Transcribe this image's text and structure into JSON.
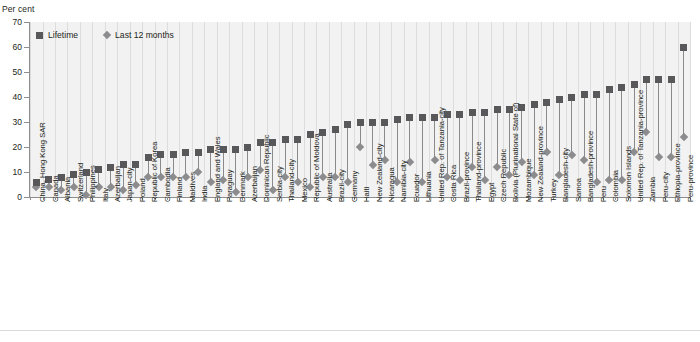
{
  "axis": {
    "y_title": "Per cent",
    "y_ticks": [
      0,
      10,
      20,
      30,
      40,
      50,
      60,
      70
    ]
  },
  "legend": {
    "items": [
      {
        "label": "Lifetime",
        "marker": "square",
        "color": "#58585a"
      },
      {
        "label": "Last 12 months",
        "marker": "diamond",
        "color": "#8c8c8e"
      }
    ]
  },
  "chart_data": {
    "type": "scatter",
    "title": "",
    "subtitle": "",
    "xlabel": "",
    "ylabel": "Per cent",
    "ylim": [
      0,
      70
    ],
    "grid": true,
    "legend_position": "top-left",
    "categories": [
      "China, Hong Kong SAR",
      "Canada",
      "Albania",
      "Switzerland",
      "Philippines",
      "Italy",
      "Azerbaijan",
      "Japan-city",
      "Poland",
      "Republic of Korea",
      "Cambodia",
      "Finland",
      "Maldives",
      "India",
      "England and Wales",
      "Paraguay",
      "Denmark",
      "Azerbaijan",
      "Dominican Republic",
      "Serbia-city",
      "Thailand-city",
      "Mexico",
      "Republic of Moldova",
      "Australia",
      "Brazil-city",
      "Germany",
      "Haiti",
      "New Zealand-city",
      "Nicaragua",
      "Namibia-city",
      "Ecuador",
      "Lithuania",
      "United Rep. of Tanzania-city",
      "Costa Rica",
      "Brazil-province",
      "Thailand-province",
      "Egypt",
      "Czech Republic",
      "Bolivia (Plurinational State of)",
      "Mozambique",
      "New Zealand-province",
      "Turkey",
      "Bangladesh-city",
      "Samoa",
      "Bangladesh-province",
      "Peru",
      "Colombia",
      "Solomon Islands",
      "United Rep. of Tanzania-province",
      "Zambia",
      "Peru-city",
      "Ethiopia-province",
      "Peru-province"
    ],
    "series": [
      {
        "name": "Lifetime",
        "marker": "square",
        "color": "#58585a",
        "values": [
          6,
          7,
          8,
          9,
          10,
          11,
          12,
          13,
          13,
          16,
          17,
          17,
          18,
          18,
          19,
          19,
          19,
          20,
          22,
          22,
          23,
          23,
          25,
          26,
          27,
          29,
          30,
          30,
          30,
          31,
          32,
          32,
          32,
          33,
          33,
          34,
          34,
          35,
          35,
          36,
          37,
          38,
          39,
          40,
          41,
          41,
          43,
          44,
          45,
          47,
          47,
          47,
          60
        ]
      },
      {
        "name": "Last 12 months",
        "marker": "diamond",
        "color": "#8c8c8e",
        "values": [
          4,
          4,
          3,
          4,
          1,
          4,
          4,
          3,
          5,
          8,
          8,
          8,
          8,
          10,
          6,
          7,
          2,
          8,
          11,
          3,
          8,
          6,
          4,
          8,
          8,
          6,
          20,
          13,
          15,
          6,
          14,
          6,
          15,
          8,
          7,
          12,
          7,
          12,
          9,
          14,
          9,
          18,
          9,
          17,
          15,
          6,
          7,
          7,
          18,
          26,
          16,
          16,
          24
        ]
      }
    ]
  }
}
